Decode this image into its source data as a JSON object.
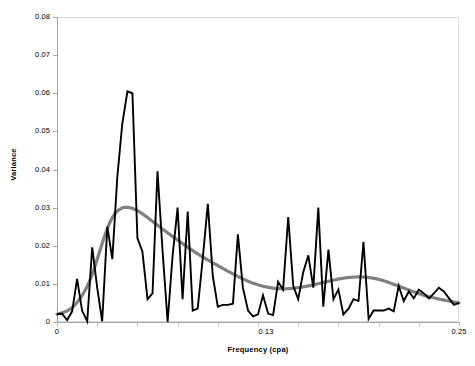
{
  "chart_data": {
    "type": "line",
    "title": "",
    "xlabel": "Frequency (cpa)",
    "ylabel": "Variance",
    "xlim": [
      0,
      0.25
    ],
    "ylim": [
      0,
      0.08
    ],
    "grid": false,
    "legend": null,
    "x_tick_labels": [
      "0",
      "0.13",
      "0.25"
    ],
    "x_tick_values": [
      0,
      0.13,
      0.25
    ],
    "y_tick_labels": [
      "0",
      "0.01",
      "0.02",
      "0.03",
      "0.04",
      "0.05",
      "0.06",
      "0.07",
      "0.08"
    ],
    "y_tick_values": [
      0,
      0.01,
      0.02,
      0.03,
      0.04,
      0.05,
      0.06,
      0.07,
      0.08
    ],
    "series": [
      {
        "name": "variance-spectrum",
        "color": "#000000",
        "style": "jagged",
        "x": [
          0.0,
          0.0031,
          0.0063,
          0.0094,
          0.0125,
          0.0156,
          0.0188,
          0.0219,
          0.025,
          0.0281,
          0.0313,
          0.0344,
          0.0375,
          0.0406,
          0.0438,
          0.0469,
          0.05,
          0.0531,
          0.0563,
          0.0594,
          0.0625,
          0.0656,
          0.0688,
          0.0719,
          0.075,
          0.0781,
          0.0813,
          0.0844,
          0.0875,
          0.0906,
          0.0938,
          0.0969,
          0.1,
          0.1031,
          0.1063,
          0.1094,
          0.1125,
          0.1156,
          0.1188,
          0.1219,
          0.125,
          0.1281,
          0.1313,
          0.1344,
          0.1375,
          0.1406,
          0.1438,
          0.1469,
          0.15,
          0.1531,
          0.1563,
          0.1594,
          0.1625,
          0.1656,
          0.1688,
          0.1719,
          0.175,
          0.1781,
          0.1813,
          0.1844,
          0.1875,
          0.1906,
          0.1938,
          0.1969,
          0.2,
          0.2031,
          0.2063,
          0.2094,
          0.2125,
          0.2156,
          0.2188,
          0.2219,
          0.225,
          0.2281,
          0.2313,
          0.2344,
          0.2375,
          0.2406,
          0.2438,
          0.2469,
          0.25
        ],
        "y": [
          0.002,
          0.0022,
          0.0005,
          0.0028,
          0.0113,
          0.003,
          0.0002,
          0.0196,
          0.009,
          0.0002,
          0.025,
          0.0165,
          0.038,
          0.052,
          0.0605,
          0.06,
          0.022,
          0.0185,
          0.006,
          0.0075,
          0.0395,
          0.019,
          0.0,
          0.0175,
          0.03,
          0.006,
          0.029,
          0.003,
          0.0035,
          0.0165,
          0.031,
          0.012,
          0.004,
          0.0045,
          0.0045,
          0.0048,
          0.023,
          0.009,
          0.003,
          0.0015,
          0.002,
          0.007,
          0.0022,
          0.0018,
          0.0105,
          0.0085,
          0.0275,
          0.0095,
          0.006,
          0.013,
          0.0175,
          0.009,
          0.03,
          0.004,
          0.019,
          0.006,
          0.0085,
          0.002,
          0.0035,
          0.006,
          0.0055,
          0.021,
          0.0008,
          0.003,
          0.003,
          0.003,
          0.0035,
          0.0028,
          0.0095,
          0.0055,
          0.008,
          0.0062,
          0.0085,
          0.0075,
          0.0062,
          0.0075,
          0.009,
          0.008,
          0.0062,
          0.0045,
          0.005
        ]
      },
      {
        "name": "smoothed-trend",
        "color": "#808080",
        "style": "smooth",
        "x": [
          0.0,
          0.01,
          0.02,
          0.03,
          0.035,
          0.04,
          0.045,
          0.05,
          0.055,
          0.06,
          0.07,
          0.08,
          0.09,
          0.1,
          0.11,
          0.12,
          0.13,
          0.14,
          0.15,
          0.16,
          0.17,
          0.18,
          0.19,
          0.2,
          0.21,
          0.22,
          0.23,
          0.24,
          0.25
        ],
        "y": [
          0.002,
          0.004,
          0.0105,
          0.023,
          0.0278,
          0.0298,
          0.03,
          0.0292,
          0.0278,
          0.0262,
          0.023,
          0.02,
          0.0172,
          0.0148,
          0.0125,
          0.0105,
          0.0092,
          0.0087,
          0.009,
          0.0098,
          0.0108,
          0.0116,
          0.0118,
          0.0112,
          0.0098,
          0.0082,
          0.0068,
          0.0058,
          0.005
        ]
      }
    ]
  },
  "axes": {
    "x_title": "Frequency (cpa)",
    "y_title": "Variance"
  }
}
